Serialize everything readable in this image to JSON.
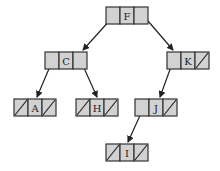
{
  "diagram": {
    "type": "binary-tree-linked-nodes",
    "colors": {
      "cell_fill": "#d2d2d2",
      "cell_border": "#333333",
      "line": "#222222"
    },
    "nodes": [
      {
        "id": "F",
        "label": "F",
        "x": 106,
        "y": 7,
        "left": "pointer",
        "right": "pointer"
      },
      {
        "id": "C",
        "label": "C",
        "x": 45,
        "y": 52,
        "left": "pointer",
        "right": "pointer"
      },
      {
        "id": "K",
        "label": "K",
        "x": 167,
        "y": 52,
        "left": "pointer",
        "right": "null"
      },
      {
        "id": "A",
        "label": "A",
        "x": 14,
        "y": 99,
        "left": "null",
        "right": "null"
      },
      {
        "id": "H",
        "label": "H",
        "x": 76,
        "y": 99,
        "left": "null",
        "right": "null"
      },
      {
        "id": "J",
        "label": "J",
        "x": 135,
        "y": 99,
        "left": "pointer",
        "right": "null"
      },
      {
        "id": "I",
        "label": "I",
        "x": 106,
        "y": 144,
        "left": "null",
        "right": "null"
      }
    ],
    "edges": [
      {
        "from": "F",
        "side": "left",
        "to": "C",
        "x1": 111,
        "y1": 19,
        "x2": 83,
        "y2": 50
      },
      {
        "from": "F",
        "side": "right",
        "to": "K",
        "x1": 142,
        "y1": 14,
        "x2": 173,
        "y2": 50
      },
      {
        "from": "C",
        "side": "left",
        "to": "A",
        "x1": 51,
        "y1": 64,
        "x2": 37,
        "y2": 97
      },
      {
        "from": "C",
        "side": "right",
        "to": "H",
        "x1": 80,
        "y1": 59,
        "x2": 97,
        "y2": 97
      },
      {
        "from": "K",
        "side": "left",
        "to": "J",
        "x1": 172,
        "y1": 64,
        "x2": 160,
        "y2": 97
      },
      {
        "from": "J",
        "side": "left",
        "to": "I",
        "x1": 142,
        "y1": 111,
        "x2": 128,
        "y2": 142
      }
    ]
  }
}
